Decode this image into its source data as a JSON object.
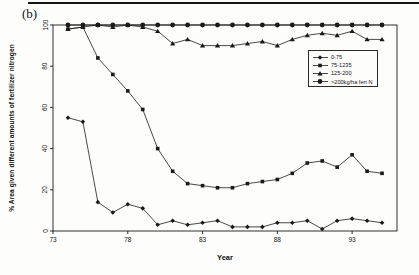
{
  "chart_data": {
    "type": "line",
    "panel_label": "(b)",
    "title": "",
    "xlabel": "Year",
    "ylabel": "% Area given different amounts of fertilizer nitrogen",
    "x": [
      74,
      75,
      76,
      77,
      78,
      79,
      80,
      81,
      82,
      83,
      84,
      85,
      86,
      87,
      88,
      89,
      90,
      91,
      92,
      93,
      94,
      95
    ],
    "x_ticks": [
      73,
      78,
      83,
      88,
      93
    ],
    "y_ticks": [
      0,
      20,
      40,
      60,
      80,
      100
    ],
    "xlim": [
      73,
      96
    ],
    "ylim": [
      0,
      100
    ],
    "grid": false,
    "legend_position": "upper-right-inside",
    "color": "#1a1a1a",
    "series": [
      {
        "name": "0-75",
        "marker": "diamond",
        "values": [
          55,
          53,
          14,
          9,
          13,
          11,
          3,
          5,
          3,
          4,
          5,
          2,
          2,
          2,
          4,
          4,
          5,
          1,
          5,
          6,
          5,
          4
        ]
      },
      {
        "name": "75-1235",
        "marker": "square",
        "values": [
          98,
          99,
          84,
          76,
          68,
          59,
          40,
          29,
          23,
          22,
          21,
          21,
          23,
          24,
          25,
          28,
          33,
          34,
          31,
          37,
          29,
          28
        ]
      },
      {
        "name": "125-200",
        "marker": "triangle",
        "values": [
          98,
          99,
          100,
          99,
          100,
          99,
          97,
          91,
          93,
          90,
          90,
          90,
          91,
          92,
          90,
          93,
          95,
          96,
          95,
          97,
          93,
          93
        ]
      },
      {
        "name": ">200kg/ha fert N",
        "marker": "circle",
        "values": [
          100,
          100,
          100,
          100,
          100,
          100,
          100,
          100,
          100,
          100,
          100,
          100,
          100,
          100,
          100,
          100,
          100,
          100,
          100,
          100,
          100,
          100
        ]
      }
    ]
  }
}
